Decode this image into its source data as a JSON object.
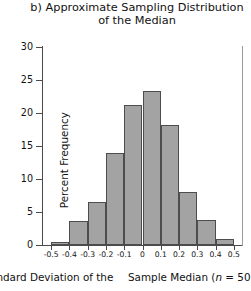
{
  "chart_data": {
    "type": "bar",
    "title": "b) Approximate Sampling Distribution\nof the Median",
    "xlabel": "Sample Median (n  =  50)",
    "ylabel": "Percent Frequency",
    "grid": false,
    "legend": "none",
    "xlim": [
      -0.55,
      0.55
    ],
    "ylim": [
      0,
      30
    ],
    "bin_width": 0.1,
    "categories": [
      "-0.45",
      "-0.35",
      "-0.25",
      "-0.15",
      "-0.05",
      "0.05",
      "0.15",
      "0.25",
      "0.35",
      "0.45"
    ],
    "values": [
      0.5,
      3.6,
      6.5,
      14.0,
      21.2,
      23.3,
      18.2,
      8.0,
      3.8,
      0.9
    ],
    "bin_edges": [
      -0.5,
      -0.4,
      -0.3,
      -0.2,
      -0.1,
      0,
      0.1,
      0.2,
      0.3,
      0.4,
      0.5
    ],
    "xticks": [
      "-0.5",
      "-0.4",
      "-0.3",
      "-0.2",
      "-0.1",
      "0",
      "0.1",
      "0.2",
      "0.3",
      "0.4",
      "0.5"
    ],
    "xtick_values": [
      -0.5,
      -0.4,
      -0.3,
      -0.2,
      -0.1,
      0,
      0.1,
      0.2,
      0.3,
      0.4,
      0.5
    ],
    "yticks": [
      "0",
      "5",
      "10",
      "15",
      "20",
      "25",
      "30"
    ],
    "ytick_values": [
      0,
      5,
      10,
      15,
      20,
      25,
      30
    ],
    "bar_color": "#a3a3a3",
    "bar_edge_color": "#4d4d4d",
    "axis_color": "#4a4a4a"
  },
  "caption": {
    "left_text": "tandard Deviation of the",
    "right_prefix": "Sample Median (",
    "right_italic": "n",
    "right_suffix": "  =   50)"
  }
}
